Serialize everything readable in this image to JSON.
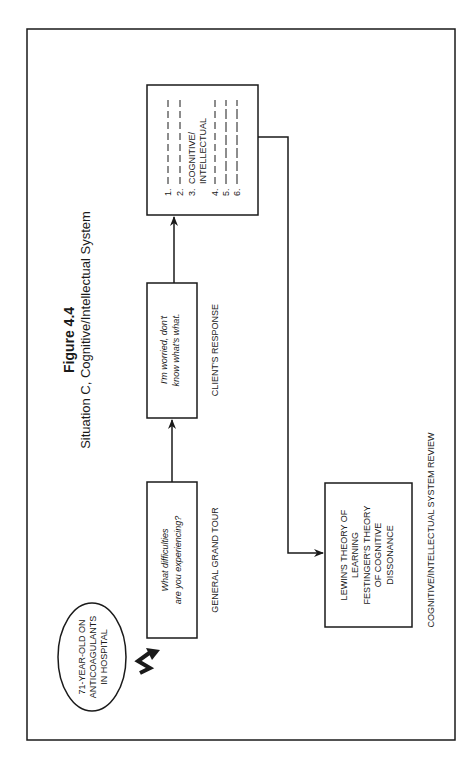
{
  "figure": {
    "number": "Figure 4.4",
    "title": "Situation C, Cognitive/Intellectual System"
  },
  "nodes": {
    "start": {
      "lines": [
        "71-YEAR-OLD ON",
        "ANTICOAGULANTS",
        "IN HOSPITAL"
      ]
    },
    "grand_tour": {
      "lines": [
        "What difficulties",
        "are you experiencing?"
      ],
      "caption": "GENERAL GRAND TOUR"
    },
    "client_response": {
      "lines": [
        "I'm worried, don't",
        "know what's what."
      ],
      "caption": "CLIENT'S RESPONSE"
    },
    "system_list": {
      "items": [
        {
          "num": "1.",
          "text": ""
        },
        {
          "num": "2.",
          "text": ""
        },
        {
          "num": "3.",
          "text": "COGNITIVE/",
          "text2": "INTELLECTUAL"
        },
        {
          "num": "4.",
          "text": ""
        },
        {
          "num": "5.",
          "text": ""
        },
        {
          "num": "6.",
          "text": ""
        }
      ]
    },
    "review": {
      "lines": [
        "LEWIN'S THEORY OF",
        "LEARNING",
        "FESTINGER'S THEORY",
        "OF COGNITIVE",
        "DISSONANCE"
      ],
      "caption": "COGNITIVE/INTELLECTUAL SYSTEM REVIEW"
    }
  }
}
